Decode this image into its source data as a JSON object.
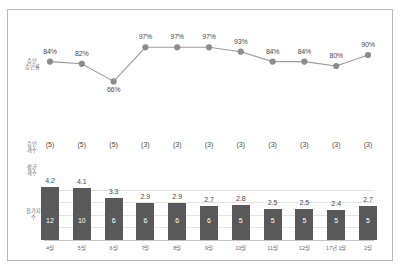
{
  "chart_data": {
    "type": "bar",
    "title": "",
    "xlabel": "",
    "ylabel": "",
    "grid": true,
    "legend": "none",
    "categories": [
      "4월",
      "5월",
      "6월",
      "7월",
      "8월",
      "9월",
      "10월",
      "11월",
      "12월",
      "17년 1월",
      "2월"
    ],
    "series": [
      {
        "name": "승인 승인률",
        "type": "line",
        "unit": "%",
        "axis_label": "승인\n승인률",
        "values": [
          84,
          82,
          66,
          97,
          97,
          97,
          93,
          84,
          84,
          80,
          90
        ],
        "labels": [
          "84%",
          "82%",
          "66%",
          "97%",
          "97%",
          "97%",
          "93%",
          "84%",
          "84%",
          "80%",
          "90%"
        ],
        "ylim": [
          60,
          100
        ],
        "color": "#9a9a9a",
        "marker_color": "#8c8c8c"
      },
      {
        "name": "승인 개수",
        "type": "table",
        "axis_label": "승인\n개수",
        "values": [
          5,
          5,
          5,
          3,
          3,
          3,
          3,
          3,
          3,
          3,
          3
        ],
        "labels": [
          "(5)",
          "(5)",
          "(5)",
          "(3)",
          "(3)",
          "(3)",
          "(3)",
          "(3)",
          "(3)",
          "(3)",
          "(3)"
        ]
      },
      {
        "name": "평균 개수",
        "type": "bar",
        "axis_label": "평균\n개수",
        "values": [
          4.2,
          4.1,
          3.3,
          2.9,
          2.9,
          2.7,
          2.8,
          2.5,
          2.5,
          2.4,
          2.7
        ],
        "labels": [
          "4.2",
          "4.1",
          "3.3",
          "2.9",
          "2.9",
          "2.7",
          "2.8",
          "2.5",
          "2.5",
          "2.4",
          "2.7"
        ],
        "ylim": [
          0,
          4.6
        ],
        "color": "#595959"
      },
      {
        "name": "참가자 수",
        "type": "table",
        "axis_label": "참가자\n수",
        "values": [
          12,
          10,
          6,
          6,
          6,
          6,
          5,
          5,
          5,
          5,
          5
        ],
        "labels": [
          "12",
          "10",
          "6",
          "6",
          "6",
          "6",
          "5",
          "5",
          "5",
          "5",
          "5"
        ]
      }
    ]
  }
}
